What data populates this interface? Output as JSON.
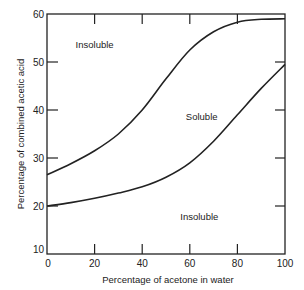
{
  "chart_data": {
    "type": "line",
    "title": "",
    "xlabel": "Percentage of acetone in water",
    "ylabel": "Percentage of combined acetic acid",
    "xlim": [
      0,
      100
    ],
    "ylim": [
      10,
      60
    ],
    "xticks": [
      0,
      20,
      40,
      60,
      80,
      100
    ],
    "yticks": [
      10,
      20,
      30,
      40,
      50,
      60
    ],
    "grid": false,
    "series": [
      {
        "name": "upper boundary",
        "x": [
          0,
          10,
          20,
          30,
          40,
          50,
          60,
          70,
          80,
          90,
          100
        ],
        "values": [
          26.5,
          28.8,
          31.5,
          35,
          40,
          46.5,
          52.5,
          56.3,
          58.3,
          58.9,
          59
        ]
      },
      {
        "name": "lower boundary",
        "x": [
          0,
          10,
          20,
          30,
          40,
          50,
          60,
          70,
          80,
          90,
          100
        ],
        "values": [
          20,
          20.7,
          21.6,
          22.7,
          24,
          26,
          29,
          33.5,
          39,
          44.5,
          49.5
        ]
      }
    ],
    "annotations": [
      {
        "text": "Insoluble",
        "x": 20,
        "y": 53
      },
      {
        "text": "Soluble",
        "x": 65,
        "y": 38
      },
      {
        "text": "Insoluble",
        "x": 64,
        "y": 17
      }
    ]
  }
}
